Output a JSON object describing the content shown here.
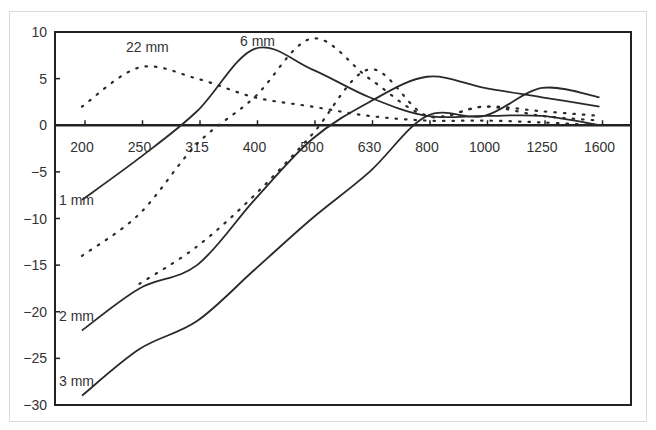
{
  "chart_data": {
    "type": "line",
    "title": "",
    "xlabel": "",
    "ylabel": "",
    "categories": [
      "200",
      "250",
      "315",
      "400",
      "500",
      "630",
      "800",
      "1000",
      "1250",
      "1600"
    ],
    "ylim": [
      -30,
      10
    ],
    "yticks": [
      10,
      5,
      0,
      -5,
      -10,
      -15,
      -20,
      -25,
      -30
    ],
    "ytick_labels": [
      "10",
      "5",
      "0",
      "−5",
      "−10",
      "−15",
      "−20",
      "−25",
      "−30"
    ],
    "grid": false,
    "legend": "none (inline annotations)",
    "annotations": [
      {
        "text": "22 mm",
        "near": "250",
        "value": 8.5
      },
      {
        "text": "6 mm",
        "near": "400",
        "value": 9.3
      },
      {
        "text": "1 mm",
        "near": "200",
        "value": -8.5
      },
      {
        "text": "2 mm",
        "near": "200",
        "value": -20.5
      },
      {
        "text": "3 mm",
        "near": "200",
        "value": -27.5
      }
    ],
    "series": [
      {
        "name": "1 mm",
        "style": "solid",
        "values": [
          -8,
          -3.5,
          1.5,
          8.2,
          6,
          3,
          1,
          1,
          1,
          0
        ]
      },
      {
        "name": "1 mm (dotted)",
        "style": "dotted",
        "values": [
          -14,
          -9.5,
          -2,
          3,
          9.3,
          5,
          1,
          2,
          1.5,
          1
        ]
      },
      {
        "name": "2 mm",
        "style": "solid",
        "values": [
          -22,
          -17.5,
          -15,
          -8,
          -1.5,
          2.5,
          5.2,
          4,
          3,
          2
        ]
      },
      {
        "name": "2 mm (dotted)",
        "style": "dotted",
        "values": [
          null,
          -17,
          -13,
          -7.5,
          -1,
          6,
          1,
          2,
          1,
          0.5
        ]
      },
      {
        "name": "3 mm",
        "style": "solid",
        "values": [
          -29,
          -24,
          -21,
          -15.5,
          -10,
          -5,
          1,
          1,
          4,
          3
        ]
      },
      {
        "name": "22 mm",
        "style": "dotted",
        "values": [
          2,
          6.2,
          5,
          3,
          2,
          1,
          0.5,
          0.5,
          0.3,
          0
        ]
      }
    ]
  }
}
